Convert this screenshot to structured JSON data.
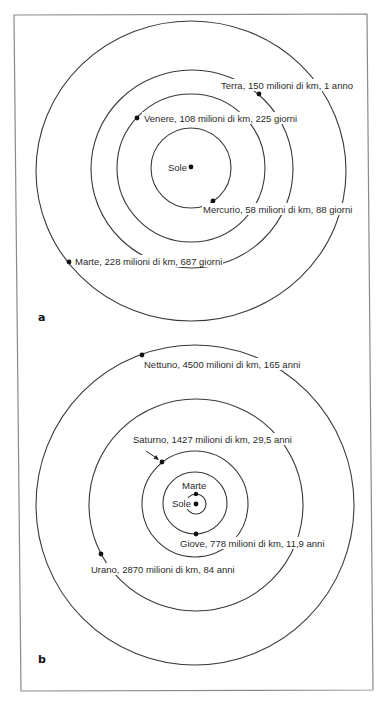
{
  "figure": {
    "panels": [
      {
        "id": "a",
        "letter": "a",
        "center": {
          "x": 191,
          "y": 169
        },
        "sun_label": "Sole",
        "planets": [
          {
            "name": "Mercurio",
            "distance": "58 milioni di km",
            "period": "88 giorni",
            "label": "Mercurio, 58 milioni di km, 88 giorni"
          },
          {
            "name": "Venere",
            "distance": "108 milioni di km",
            "period": "225 giorni",
            "label": "Venere, 108 milioni di km, 225 giorni"
          },
          {
            "name": "Terra",
            "distance": "150 milioni di km",
            "period": "1 anno",
            "label": "Terra, 150 milioni di km, 1 anno"
          },
          {
            "name": "Marte",
            "distance": "228 milioni di km",
            "period": "687 giorni",
            "label": "Marte, 228 milioni di km, 687 giorni"
          }
        ]
      },
      {
        "id": "b",
        "letter": "b",
        "center": {
          "x": 195,
          "y": 504
        },
        "sun_label": "Sole",
        "planets": [
          {
            "name": "Marte",
            "label": "Marte"
          },
          {
            "name": "Giove",
            "distance": "778 milioni di km",
            "period": "11,9 anni",
            "label": "Giove, 778 milioni di km, 11,9 anni"
          },
          {
            "name": "Saturno",
            "distance": "1427 milioni di km",
            "period": "29,5 anni",
            "label": "Saturno, 1427 milioni di km, 29,5 anni"
          },
          {
            "name": "Urano",
            "distance": "2870 milioni di km",
            "period": "84 anni",
            "label": "Urano, 2870 milioni di km, 84 anni"
          },
          {
            "name": "Nettuno",
            "distance": "4500 milioni di km",
            "period": "165 anni",
            "label": "Nettuno, 4500 milioni di km, 165 anni"
          }
        ]
      }
    ],
    "colors": {
      "orbit": "#3a3a3a",
      "frame": "#8a8a8a",
      "dot": "#111111",
      "text": "#2a2a2a",
      "background": "#ffffff"
    }
  }
}
